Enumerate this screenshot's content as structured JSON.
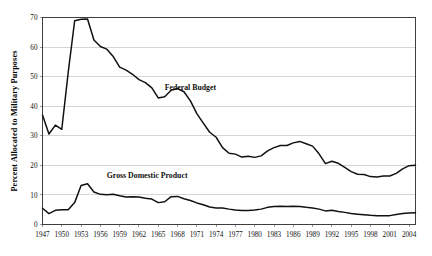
{
  "chart_data": {
    "type": "line",
    "title": "",
    "xlabel": "",
    "ylabel": "Percent Allocated to Military Purposes",
    "ylim": [
      0,
      70
    ],
    "xlim": [
      1947,
      2005
    ],
    "grid": true,
    "grid_axis": "y",
    "legend": "inline-labels",
    "ytick_labels": [
      "0",
      "10",
      "20",
      "30",
      "40",
      "50",
      "60",
      "70"
    ],
    "yticks": [
      0,
      10,
      20,
      30,
      40,
      50,
      60,
      70
    ],
    "xtick_labels": [
      "1947",
      "1950",
      "1953",
      "1956",
      "1959",
      "1962",
      "1965",
      "1968",
      "1971",
      "1974",
      "1977",
      "1980",
      "1983",
      "1986",
      "1989",
      "1992",
      "1995",
      "1998",
      "2001",
      "2004"
    ],
    "xticks": [
      1947,
      1950,
      1953,
      1956,
      1959,
      1962,
      1965,
      1968,
      1971,
      1974,
      1977,
      1980,
      1983,
      1986,
      1989,
      1992,
      1995,
      1998,
      2001,
      2004
    ],
    "x": [
      1947,
      1948,
      1949,
      1950,
      1951,
      1952,
      1953,
      1954,
      1955,
      1956,
      1957,
      1958,
      1959,
      1960,
      1961,
      1962,
      1963,
      1964,
      1965,
      1966,
      1967,
      1968,
      1969,
      1970,
      1971,
      1972,
      1973,
      1974,
      1975,
      1976,
      1977,
      1978,
      1979,
      1980,
      1981,
      1982,
      1983,
      1984,
      1985,
      1986,
      1987,
      1988,
      1989,
      1990,
      1991,
      1992,
      1993,
      1994,
      1995,
      1996,
      1997,
      1998,
      1999,
      2000,
      2001,
      2002,
      2003,
      2004,
      2005
    ],
    "series": [
      {
        "name": "Federal Budget",
        "label_text": "Federal Budget",
        "color": "#111111",
        "values": [
          37.0,
          30.6,
          33.6,
          32.2,
          51.5,
          68.9,
          69.4,
          69.5,
          62.4,
          60.2,
          59.3,
          56.8,
          53.2,
          52.2,
          50.8,
          49.0,
          48.0,
          46.2,
          42.8,
          43.2,
          45.4,
          46.0,
          44.9,
          41.8,
          37.5,
          34.3,
          31.2,
          29.5,
          26.0,
          24.1,
          23.8,
          22.8,
          23.1,
          22.7,
          23.2,
          24.9,
          26.0,
          26.7,
          26.7,
          27.6,
          28.1,
          27.3,
          26.5,
          23.9,
          20.6,
          21.4,
          20.7,
          19.3,
          17.9,
          17.0,
          16.9,
          16.2,
          16.1,
          16.4,
          16.4,
          17.3,
          18.8,
          19.9,
          20.0
        ]
      },
      {
        "name": "Gross Domestic Product",
        "label_text": "Gross Domestic Product",
        "color": "#111111",
        "values": [
          5.5,
          3.7,
          4.8,
          5.0,
          5.0,
          7.4,
          13.2,
          13.8,
          11.0,
          10.2,
          10.1,
          10.2,
          9.7,
          9.3,
          9.4,
          9.3,
          8.9,
          8.6,
          7.4,
          7.7,
          9.4,
          9.5,
          8.7,
          8.1,
          7.3,
          6.7,
          5.9,
          5.6,
          5.6,
          5.2,
          4.9,
          4.7,
          4.7,
          4.9,
          5.2,
          5.8,
          6.1,
          6.2,
          6.1,
          6.2,
          6.1,
          5.8,
          5.6,
          5.2,
          4.6,
          4.8,
          4.4,
          4.1,
          3.7,
          3.5,
          3.3,
          3.1,
          3.0,
          3.0,
          3.0,
          3.4,
          3.7,
          3.9,
          4.0
        ]
      }
    ],
    "annotations": [
      {
        "text": "Federal Budget",
        "x": 1966,
        "y": 45.5
      },
      {
        "text": "Gross Domestic Product",
        "x": 1957,
        "y": 15.6
      }
    ]
  }
}
